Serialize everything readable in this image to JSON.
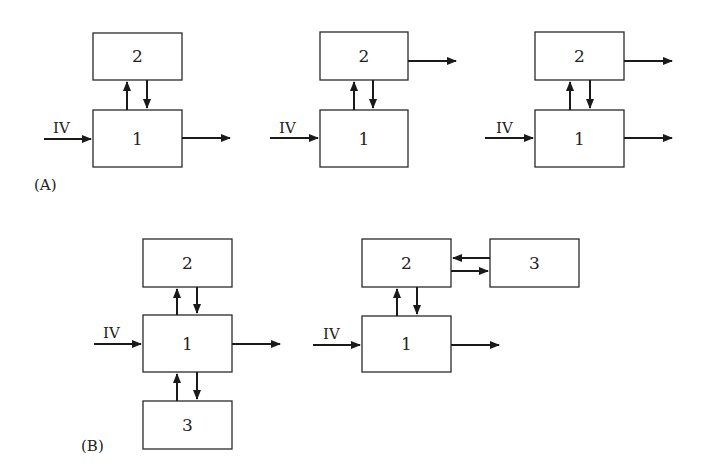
{
  "panels": {
    "A": {
      "caption": "(A)"
    },
    "B": {
      "caption": "(B)"
    }
  },
  "input_label": "IV",
  "diagrams": [
    {
      "id": "A1",
      "boxes": {
        "b1": "1",
        "b2": "2"
      },
      "outputs": [
        "1"
      ]
    },
    {
      "id": "A2",
      "boxes": {
        "b1": "1",
        "b2": "2"
      },
      "outputs": [
        "2"
      ]
    },
    {
      "id": "A3",
      "boxes": {
        "b1": "1",
        "b2": "2"
      },
      "outputs": [
        "1",
        "2"
      ]
    },
    {
      "id": "B1",
      "boxes": {
        "b1": "1",
        "b2": "2",
        "b3": "3"
      },
      "outputs": [
        "1"
      ]
    },
    {
      "id": "B2",
      "boxes": {
        "b1": "1",
        "b2": "2",
        "b3": "3"
      },
      "outputs": [
        "1"
      ]
    }
  ]
}
